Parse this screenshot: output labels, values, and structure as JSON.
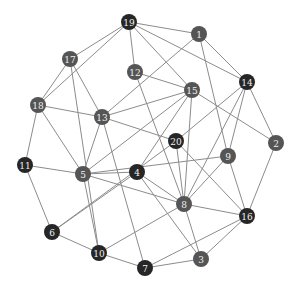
{
  "graph": {
    "width": 299,
    "height": 293,
    "node_radius": 8,
    "colors": {
      "dark": "#262626",
      "medium": "#555555",
      "edge": "#8c8c8c",
      "label": "#f0f0f0"
    },
    "nodes": [
      {
        "id": "1",
        "x": 199,
        "y": 34,
        "shade": "medium"
      },
      {
        "id": "2",
        "x": 276,
        "y": 143,
        "shade": "medium"
      },
      {
        "id": "3",
        "x": 201,
        "y": 259,
        "shade": "medium"
      },
      {
        "id": "4",
        "x": 137,
        "y": 172,
        "shade": "dark"
      },
      {
        "id": "5",
        "x": 83,
        "y": 174,
        "shade": "medium"
      },
      {
        "id": "6",
        "x": 52,
        "y": 232,
        "shade": "dark"
      },
      {
        "id": "7",
        "x": 145,
        "y": 268,
        "shade": "dark"
      },
      {
        "id": "8",
        "x": 184,
        "y": 204,
        "shade": "medium"
      },
      {
        "id": "9",
        "x": 228,
        "y": 156,
        "shade": "medium"
      },
      {
        "id": "10",
        "x": 99,
        "y": 253,
        "shade": "dark"
      },
      {
        "id": "11",
        "x": 25,
        "y": 165,
        "shade": "dark"
      },
      {
        "id": "12",
        "x": 135,
        "y": 72,
        "shade": "medium"
      },
      {
        "id": "13",
        "x": 102,
        "y": 117,
        "shade": "medium"
      },
      {
        "id": "14",
        "x": 247,
        "y": 82,
        "shade": "dark"
      },
      {
        "id": "15",
        "x": 192,
        "y": 90,
        "shade": "medium"
      },
      {
        "id": "16",
        "x": 247,
        "y": 216,
        "shade": "dark"
      },
      {
        "id": "17",
        "x": 70,
        "y": 59,
        "shade": "medium"
      },
      {
        "id": "18",
        "x": 38,
        "y": 105,
        "shade": "medium"
      },
      {
        "id": "19",
        "x": 129,
        "y": 22,
        "shade": "dark"
      },
      {
        "id": "20",
        "x": 176,
        "y": 141,
        "shade": "dark"
      }
    ],
    "edges": [
      [
        "19",
        "1"
      ],
      [
        "19",
        "17"
      ],
      [
        "19",
        "18"
      ],
      [
        "19",
        "12"
      ],
      [
        "19",
        "15"
      ],
      [
        "19",
        "14"
      ],
      [
        "1",
        "13"
      ],
      [
        "1",
        "14"
      ],
      [
        "1",
        "9"
      ],
      [
        "17",
        "18"
      ],
      [
        "17",
        "13"
      ],
      [
        "17",
        "10"
      ],
      [
        "12",
        "15"
      ],
      [
        "12",
        "8"
      ],
      [
        "14",
        "20"
      ],
      [
        "14",
        "9"
      ],
      [
        "14",
        "2"
      ],
      [
        "14",
        "8"
      ],
      [
        "15",
        "13"
      ],
      [
        "15",
        "4"
      ],
      [
        "15",
        "8"
      ],
      [
        "15",
        "2"
      ],
      [
        "15",
        "5"
      ],
      [
        "18",
        "13"
      ],
      [
        "18",
        "11"
      ],
      [
        "18",
        "5"
      ],
      [
        "13",
        "20"
      ],
      [
        "13",
        "5"
      ],
      [
        "13",
        "7"
      ],
      [
        "20",
        "8"
      ],
      [
        "20",
        "16"
      ],
      [
        "20",
        "6"
      ],
      [
        "9",
        "5"
      ],
      [
        "9",
        "8"
      ],
      [
        "9",
        "16"
      ],
      [
        "2",
        "16"
      ],
      [
        "11",
        "5"
      ],
      [
        "11",
        "6"
      ],
      [
        "5",
        "4"
      ],
      [
        "5",
        "8"
      ],
      [
        "5",
        "10"
      ],
      [
        "4",
        "3"
      ],
      [
        "4",
        "8"
      ],
      [
        "4",
        "6"
      ],
      [
        "8",
        "16"
      ],
      [
        "8",
        "3"
      ],
      [
        "8",
        "10"
      ],
      [
        "16",
        "3"
      ],
      [
        "16",
        "7"
      ],
      [
        "6",
        "10"
      ],
      [
        "10",
        "7"
      ],
      [
        "7",
        "3"
      ]
    ]
  }
}
